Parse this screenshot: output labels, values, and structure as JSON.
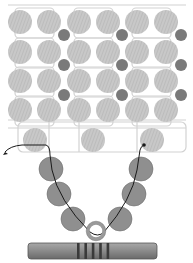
{
  "diagram": {
    "colors": {
      "background": "#ffffff",
      "large_bead": "#c8c8c8",
      "large_bead_stripe": "#b4b4b4",
      "small_bead": "#7a7a7a",
      "v_bead": "#8f8f8f",
      "v_bead_stroke": "#6e6e6e",
      "thread_grid": "#d2d2d2",
      "thread_active": "#1a1a1a",
      "ring": "#9a9a9a",
      "bar": "#8a8a8a",
      "bar_stripe": "#3a3a3a"
    },
    "grid_beads": {
      "columns_x": [
        20,
        49,
        79,
        108,
        137,
        166
      ],
      "rows_y": [
        22,
        52,
        81,
        110
      ],
      "radius": 12
    },
    "small_beads": {
      "positions": [
        {
          "x": 64,
          "y": 35
        },
        {
          "x": 122,
          "y": 35
        },
        {
          "x": 181,
          "y": 35
        },
        {
          "x": 64,
          "y": 65
        },
        {
          "x": 122,
          "y": 65
        },
        {
          "x": 181,
          "y": 65
        },
        {
          "x": 64,
          "y": 95
        },
        {
          "x": 122,
          "y": 95
        },
        {
          "x": 181,
          "y": 95
        }
      ],
      "radius": 6
    },
    "bottom_beads": {
      "positions": [
        {
          "x": 35,
          "y": 140
        },
        {
          "x": 93,
          "y": 140
        },
        {
          "x": 152,
          "y": 140
        }
      ],
      "radius": 12
    },
    "v_beads": {
      "positions": [
        {
          "x": 51,
          "y": 169
        },
        {
          "x": 59,
          "y": 194
        },
        {
          "x": 73,
          "y": 219
        },
        {
          "x": 141,
          "y": 169
        },
        {
          "x": 134,
          "y": 194
        },
        {
          "x": 120,
          "y": 219
        }
      ],
      "radius": 12
    },
    "thread_start_dot": {
      "x": 144,
      "y": 145
    },
    "ring": {
      "x": 96,
      "y": 231,
      "r": 8
    },
    "toggle_bar": {
      "x": 28,
      "y": 243,
      "width": 129,
      "height": 16,
      "stripes": 5
    }
  }
}
